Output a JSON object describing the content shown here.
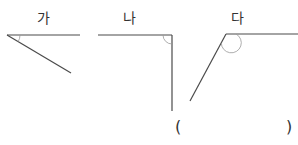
{
  "figures": [
    {
      "label": "가",
      "angle_type": "acute"
    },
    {
      "label": "나",
      "angle_type": "right"
    },
    {
      "label": "다",
      "angle_type": "obtuse"
    }
  ],
  "answer": {
    "open": "(",
    "close": ")",
    "value": ""
  },
  "colors": {
    "line": "#4a4a4a",
    "arc": "#888888",
    "text": "#333333"
  }
}
